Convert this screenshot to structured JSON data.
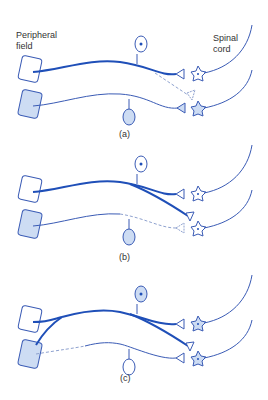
{
  "labels": {
    "peripheral_field_line1": "Peripheral",
    "peripheral_field_line2": "field",
    "spinal_cord_line1": "Spinal",
    "spinal_cord_line2": "cord"
  },
  "panels": [
    {
      "id": "a",
      "label": "(a)"
    },
    {
      "id": "b",
      "label": "(b)"
    },
    {
      "id": "c",
      "label": "(c)"
    }
  ],
  "colors": {
    "strong_line": "#1f4fb8",
    "thin_line": "#3a5bb5",
    "cell_fill": "#cddcf3",
    "dashed": "#8fa2cf"
  }
}
